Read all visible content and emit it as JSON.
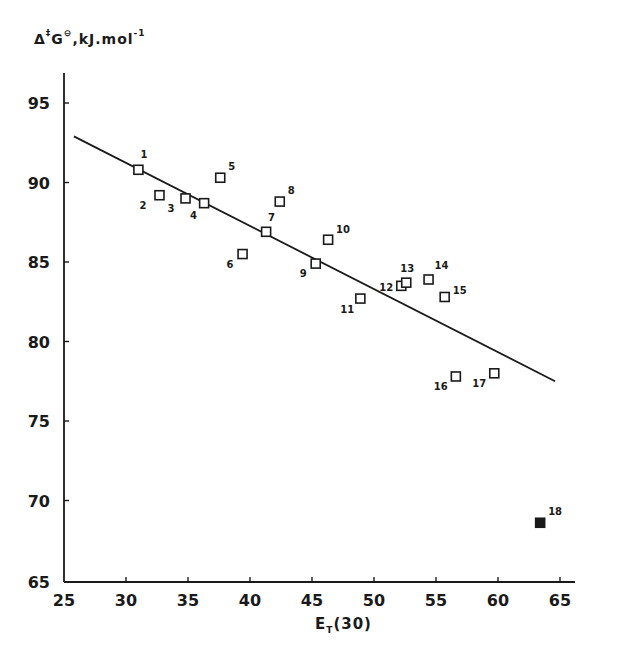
{
  "chart_data": {
    "type": "scatter",
    "title": "",
    "ylabel": "Δ‡G⊖, kJ.mol⁻¹",
    "ylabel_parts": {
      "prefix": "Δ",
      "sup1": "‡",
      "mid": "G",
      "sup2": "⊖",
      "suffix": ",kJ.mol",
      "sup3": "-1"
    },
    "xlabel": "E_T(30)",
    "xlabel_parts": {
      "main": "E",
      "sub": "T",
      "suffix": "(30)"
    },
    "xlim": [
      25,
      67
    ],
    "ylim": [
      65,
      97
    ],
    "xticks": [
      25,
      30,
      35,
      40,
      45,
      50,
      55,
      60,
      65
    ],
    "yticks": [
      65,
      70,
      75,
      80,
      85,
      90,
      95
    ],
    "grid": false,
    "legend": null,
    "series": [
      {
        "name": "solvents",
        "marker": "open-square",
        "points": [
          {
            "label": "1",
            "x": 31.0,
            "y": 90.8
          },
          {
            "label": "2",
            "x": 32.7,
            "y": 89.2
          },
          {
            "label": "3",
            "x": 34.8,
            "y": 89.0
          },
          {
            "label": "4",
            "x": 36.3,
            "y": 88.7
          },
          {
            "label": "5",
            "x": 37.6,
            "y": 90.3
          },
          {
            "label": "6",
            "x": 39.4,
            "y": 85.5
          },
          {
            "label": "7",
            "x": 41.3,
            "y": 86.9
          },
          {
            "label": "8",
            "x": 42.4,
            "y": 88.8
          },
          {
            "label": "9",
            "x": 45.3,
            "y": 84.9
          },
          {
            "label": "10",
            "x": 46.3,
            "y": 86.4
          },
          {
            "label": "11",
            "x": 48.9,
            "y": 82.7
          },
          {
            "label": "12",
            "x": 52.2,
            "y": 83.5
          },
          {
            "label": "13",
            "x": 52.6,
            "y": 83.7
          },
          {
            "label": "14",
            "x": 54.4,
            "y": 83.9
          },
          {
            "label": "15",
            "x": 55.7,
            "y": 82.8
          },
          {
            "label": "16",
            "x": 56.6,
            "y": 77.8
          },
          {
            "label": "17",
            "x": 59.7,
            "y": 78.0
          }
        ]
      },
      {
        "name": "excluded",
        "marker": "filled-square",
        "points": [
          {
            "label": "18",
            "x": 63.4,
            "y": 68.6
          }
        ]
      }
    ],
    "fit_line": {
      "x": [
        25.8,
        64.6
      ],
      "y": [
        92.9,
        77.5
      ]
    }
  }
}
